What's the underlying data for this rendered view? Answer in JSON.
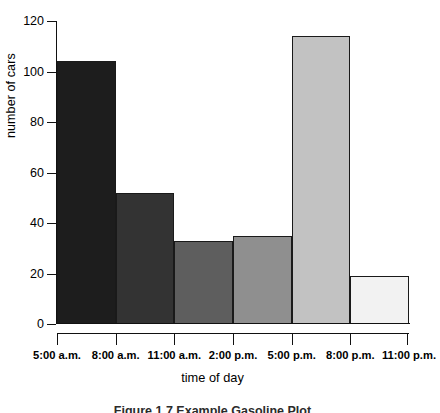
{
  "chart_data": {
    "type": "bar",
    "title": "",
    "subtitle": "",
    "xlabel": "time of day",
    "ylabel": "number of cars",
    "categories": [
      "5:00 a.m. - 8:00 a.m.",
      "8:00 a.m. - 11:00 a.m.",
      "11:00 a.m. - 2:00 p.m.",
      "2:00 p.m. - 5:00 p.m.",
      "5:00 p.m. - 8:00 p.m.",
      "8:00 p.m. - 11:00 p.m."
    ],
    "values": [
      104,
      52,
      33,
      35,
      114,
      19
    ],
    "bin_edges": [
      "5:00 a.m.",
      "8:00 a.m.",
      "11:00 a.m.",
      "2:00 p.m.",
      "5:00 p.m.",
      "8:00 p.m.",
      "11:00 p.m."
    ],
    "bar_colors": [
      "#1d1d1d",
      "#333333",
      "#5e5e5e",
      "#8f8f8f",
      "#c2c2c2",
      "#f2f2f2"
    ],
    "bar_border_color": "#1a1a1a",
    "ylim": [
      0,
      120
    ],
    "yticks": [
      0,
      20,
      40,
      60,
      80,
      100,
      120
    ],
    "ytick_labels": [
      "0",
      "20",
      "40",
      "60",
      "80",
      "100",
      "120"
    ],
    "grid": false,
    "legend": "none"
  },
  "axes": {
    "y_title": "number of cars",
    "x_title": "time of day"
  },
  "caption": {
    "text": "Figure 1.7  Example Gasoline Plot"
  }
}
